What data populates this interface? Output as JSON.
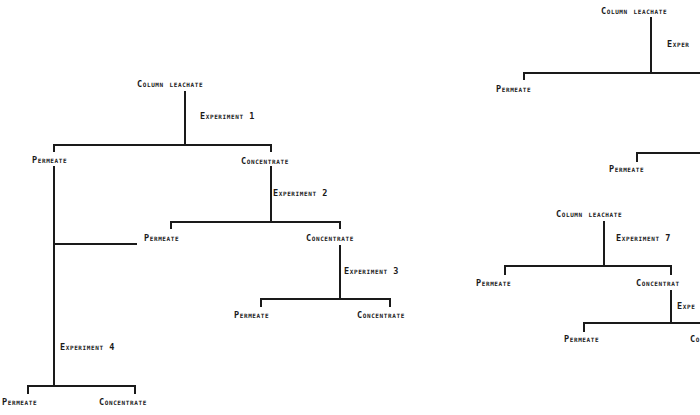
{
  "diagram": {
    "type": "flow-tree",
    "style": {
      "line_color": "#1a1a1a",
      "background": "#ffffff"
    },
    "left_tree": {
      "root": "COLUMN LEACHATE",
      "experiments": [
        {
          "id": 1,
          "label": "EXPERIMENT 1",
          "input": "COLUMN LEACHATE",
          "outputs": [
            "PERMEATE",
            "CONCENTRATE"
          ]
        },
        {
          "id": 2,
          "label": "EXPERIMENT 2",
          "input": "CONCENTRATE",
          "outputs": [
            "PERMEATE",
            "CONCENTRATE"
          ]
        },
        {
          "id": 3,
          "label": "EXPERIMENT 3",
          "input": "CONCENTRATE",
          "outputs": [
            "PERMEATE",
            "CONCENTRATE"
          ]
        },
        {
          "id": 4,
          "label": "EXPERIMENT 4",
          "input": "PERMEATE",
          "outputs": [
            "PERMEATE",
            "CONCENTRATE"
          ]
        }
      ],
      "labels": {
        "root": "COLUMN LEACHATE",
        "exp1": "EXPERIMENT 1",
        "exp1_permeate": "PERMEATE",
        "exp1_concentrate": "CONCENTRATE",
        "exp2": "EXPERIMENT 2",
        "exp2_permeate": "PERMEATE",
        "exp2_concentrate": "CONCENTRATE",
        "exp3": "EXPERIMENT 3",
        "exp3_permeate": "PERMEATE",
        "exp3_concentrate": "CONCENTRATE",
        "exp4": "EXPERIMENT 4",
        "exp4_permeate": "PERMEATE",
        "exp4_concentrate": "CONCENTRATE"
      }
    },
    "right_tree_top": {
      "labels": {
        "root": "COLUMN LEACHATE",
        "exp_partial": "EXPER",
        "permeate_1": "PERMEATE",
        "permeate_2": "PERMEATE"
      }
    },
    "right_tree_bottom": {
      "labels": {
        "root": "COLUMN LEACHATE",
        "exp7": "EXPERIMENT 7",
        "exp7_permeate": "PERMEATE",
        "exp7_concentrate": "CONCENTRAT",
        "exp_next_partial": "EXPE",
        "next_permeate": "PERMEATE",
        "next_concentrate_partial": "CO"
      }
    }
  }
}
